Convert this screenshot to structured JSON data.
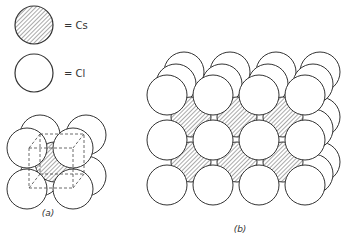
{
  "legend": {
    "cs_label": "= Cs",
    "cl_label": "= Cl"
  },
  "panels": [
    {
      "id": "a",
      "caption": "(a)",
      "description": "CsCl unit cell: Cs at body center, Cl at cube corners"
    },
    {
      "id": "b",
      "caption": "(b)",
      "description": "Extended CsCl lattice, 4x3 Cl front grid with Cs in interstices"
    }
  ],
  "colors": {
    "stroke": "#333333",
    "fill_cl": "#ffffff",
    "hatch": "#555555"
  }
}
